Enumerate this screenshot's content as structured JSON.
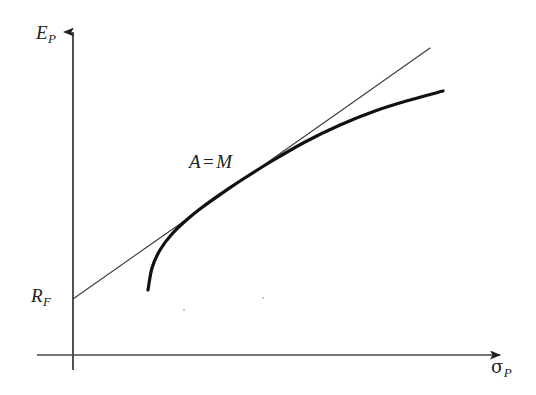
{
  "figure": {
    "kind": "line-chart",
    "background_color": "#ffffff",
    "ink_color": "#231f20",
    "axes": {
      "y_axis": {
        "name": "expected-return-axis",
        "label_base": "E",
        "label_sub": "P",
        "label_text": "E_P",
        "arrow": "up",
        "x_px": 73,
        "top_px": 28,
        "bottom_px": 370
      },
      "x_axis": {
        "name": "risk-axis",
        "label_base": "σ",
        "label_sub": "P",
        "label_text": "σ_P",
        "arrow": "right",
        "y_px": 355,
        "left_px": 37,
        "right_px": 508
      },
      "intercept": {
        "label_base": "R",
        "label_sub": "F",
        "label_text": "R_F",
        "y_px": 299
      }
    },
    "annotations": [
      {
        "name": "tangency-point-label",
        "left": "A",
        "operator": "=",
        "right": "M",
        "text": "A = M",
        "x_px": 189,
        "y_px": 152
      }
    ]
  },
  "chart_data": {
    "type": "line",
    "title": "",
    "subtitle": "",
    "xlabel": "σ_P",
    "ylabel": "E_P",
    "xlim": [
      0,
      520
    ],
    "ylim": [
      0,
      360
    ],
    "grid": false,
    "legend": false,
    "legend_position": "none",
    "axis_units": "pixel-space (origin at x=73, y=355; y increases upward on screen as pixel value decreases)",
    "series": [
      {
        "name": "capital-market-line",
        "role": "tangent line from risk-free rate through tangency portfolio",
        "style": "thin-solid",
        "stroke_width": 1.1,
        "color": "#3a3a3c",
        "points": [
          {
            "x": 73,
            "y": 299
          },
          {
            "x": 147,
            "y": 247
          },
          {
            "x": 220,
            "y": 196
          },
          {
            "x": 278,
            "y": 155
          },
          {
            "x": 352,
            "y": 103
          },
          {
            "x": 430,
            "y": 48
          }
        ]
      },
      {
        "name": "efficient-frontier-curve",
        "role": "concave risky-asset efficient frontier",
        "style": "thick-solid",
        "stroke_width": 3.2,
        "color": "#111111",
        "points": [
          {
            "x": 148,
            "y": 290
          },
          {
            "x": 152,
            "y": 268
          },
          {
            "x": 160,
            "y": 250
          },
          {
            "x": 172,
            "y": 234
          },
          {
            "x": 190,
            "y": 217
          },
          {
            "x": 212,
            "y": 200
          },
          {
            "x": 240,
            "y": 181
          },
          {
            "x": 272,
            "y": 161
          },
          {
            "x": 305,
            "y": 142
          },
          {
            "x": 340,
            "y": 125
          },
          {
            "x": 375,
            "y": 111
          },
          {
            "x": 410,
            "y": 100
          },
          {
            "x": 443,
            "y": 91
          }
        ]
      }
    ],
    "markers": [
      {
        "name": "tangency-point",
        "label": "A = M",
        "x": 278,
        "y": 173,
        "note": "point where the capital market line touches the efficient frontier"
      },
      {
        "name": "risk-free-intercept",
        "label": "R_F",
        "x": 73,
        "y": 299,
        "note": "vertical-axis intercept of the capital market line"
      }
    ]
  }
}
